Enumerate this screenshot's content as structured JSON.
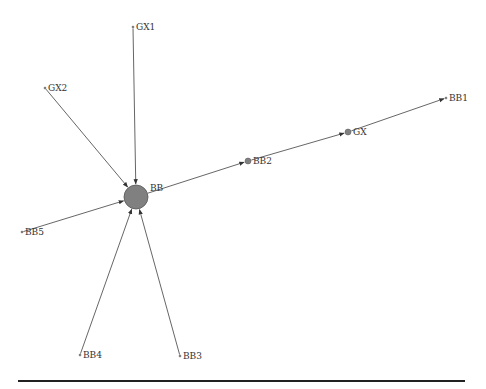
{
  "diagram": {
    "type": "directed-network",
    "colors": {
      "edge": "#555555",
      "hub_node": "#808080",
      "small_node": "#808080",
      "label": "#333333",
      "rule": "#222222"
    },
    "nodes": [
      {
        "id": "BB",
        "label": "BB",
        "x": 136,
        "y": 197,
        "r": 12
      },
      {
        "id": "GX1",
        "label": "GX1",
        "x": 133,
        "y": 27,
        "r": 1
      },
      {
        "id": "GX2",
        "label": "GX2",
        "x": 45,
        "y": 88,
        "r": 1
      },
      {
        "id": "BB1",
        "label": "BB1",
        "x": 446,
        "y": 98,
        "r": 1
      },
      {
        "id": "GX",
        "label": "GX",
        "x": 348,
        "y": 132,
        "r": 3
      },
      {
        "id": "BB2",
        "label": "BB2",
        "x": 248,
        "y": 161,
        "r": 3
      },
      {
        "id": "BB5",
        "label": "BB5",
        "x": 22,
        "y": 232,
        "r": 1
      },
      {
        "id": "BB4",
        "label": "BB4",
        "x": 80,
        "y": 355,
        "r": 1
      },
      {
        "id": "BB3",
        "label": "BB3",
        "x": 180,
        "y": 356,
        "r": 1
      }
    ],
    "edges": [
      {
        "from": "GX1",
        "to": "BB"
      },
      {
        "from": "GX2",
        "to": "BB"
      },
      {
        "from": "BB5",
        "to": "BB"
      },
      {
        "from": "BB4",
        "to": "BB"
      },
      {
        "from": "BB3",
        "to": "BB"
      },
      {
        "from": "BB",
        "to": "BB2"
      },
      {
        "from": "BB2",
        "to": "GX"
      },
      {
        "from": "GX",
        "to": "BB1"
      }
    ]
  }
}
